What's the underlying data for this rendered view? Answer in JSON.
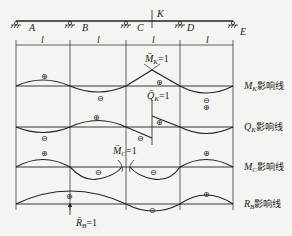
{
  "beam": {
    "supports": [
      "A",
      "B",
      "C",
      "D",
      "E"
    ],
    "section_label": "K",
    "span_labels": [
      "l",
      "l",
      "l",
      "l"
    ]
  },
  "influence_lines": [
    {
      "name": "M_K",
      "label_sym": "M",
      "label_sub": "K",
      "label_cn": "影响线",
      "unit_action": "M̄",
      "unit_sub": "K",
      "unit_eq": "=1",
      "signs": [
        "+",
        "−",
        "+",
        "−"
      ]
    },
    {
      "name": "Q_K",
      "label_sym": "Q",
      "label_sub": "K",
      "label_cn": "影响线",
      "unit_action": "Q̄",
      "unit_sub": "K",
      "unit_eq": "=1",
      "signs": [
        "−",
        "+",
        "−",
        "+",
        "+"
      ]
    },
    {
      "name": "M_C",
      "label_sym": "M",
      "label_sub": "C",
      "label_cn": "影响线",
      "unit_action": "M̄",
      "unit_sub": "C",
      "unit_eq": "=1",
      "signs": [
        "+",
        "−",
        "−",
        "+"
      ]
    },
    {
      "name": "R_B",
      "label_sym": "R",
      "label_sub": "B",
      "label_cn": "影响线",
      "unit_action": "R̄",
      "unit_sub": "B",
      "unit_eq": "=1",
      "signs": [
        "+",
        "−",
        "+"
      ]
    }
  ],
  "colors": {
    "line": "#222222",
    "background": "#f4f4f2"
  }
}
